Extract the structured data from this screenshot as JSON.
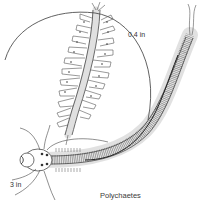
{
  "figure": {
    "subject": "Polychaetes",
    "caption": "Polychaetes",
    "scale_labels": {
      "small_worm": "0.4 in",
      "large_worm": "3 in"
    },
    "colors": {
      "background": "#ffffff",
      "ink": "#2a2a2a",
      "light_ink": "#8a8a8a"
    }
  }
}
